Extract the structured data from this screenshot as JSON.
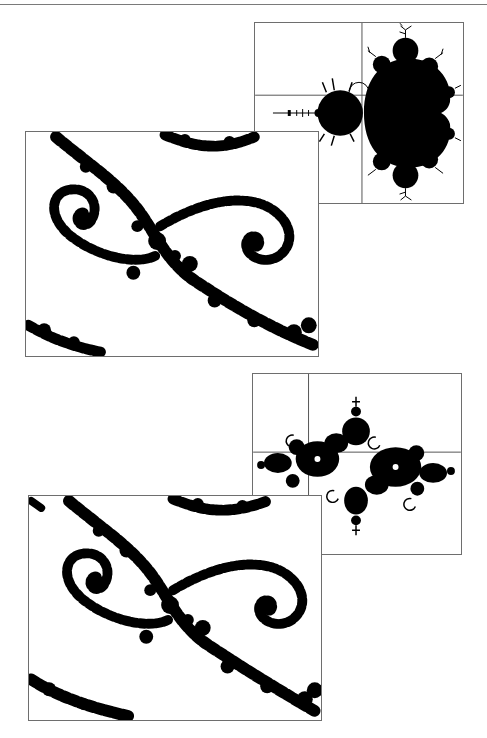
{
  "page": {
    "header_rule": true,
    "background": "#ffffff",
    "ink": "#000000",
    "frame_color": "#6e6e6e"
  },
  "figures": [
    {
      "id": "mandelbrot-overview",
      "subject": "Mandelbrot set with crosshair locating zoom point",
      "crosshair": {
        "x": 362,
        "y": 95
      }
    },
    {
      "id": "julia-zoom-1",
      "subject": "Magnified fractal detail with double spirals"
    },
    {
      "id": "julia-overview",
      "subject": "Julia set with crosshair locating zoom point",
      "crosshair": {
        "x": 308,
        "y": 452
      }
    },
    {
      "id": "julia-zoom-2",
      "subject": "Magnified Julia set detail with double spirals"
    }
  ]
}
